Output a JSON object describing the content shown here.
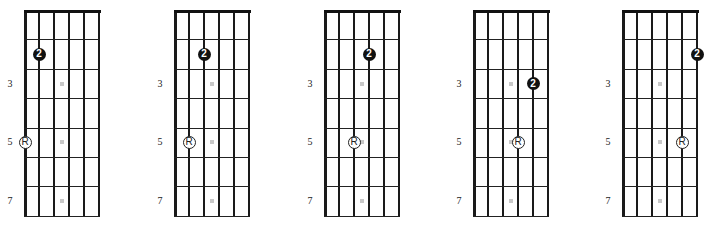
{
  "layout": {
    "diagram_lefts": [
      24,
      174,
      324,
      473,
      622
    ],
    "string_spacing": 15,
    "fret_spacing": 29.4,
    "grid_top": 10
  },
  "fret_labels": [
    {
      "text": "3",
      "row": 3
    },
    {
      "text": "5",
      "row": 5
    },
    {
      "text": "7",
      "row": 7
    }
  ],
  "inlay_rows": [
    3,
    5,
    7
  ],
  "diagrams": [
    {
      "name": "diagram-1",
      "finger": {
        "label": "2",
        "string": 2,
        "row": 2
      },
      "root": {
        "label": "R",
        "string": 1,
        "row": 5
      }
    },
    {
      "name": "diagram-2",
      "finger": {
        "label": "2",
        "string": 3,
        "row": 2
      },
      "root": {
        "label": "R",
        "string": 2,
        "row": 5
      }
    },
    {
      "name": "diagram-3",
      "finger": {
        "label": "2",
        "string": 4,
        "row": 2
      },
      "root": {
        "label": "R",
        "string": 3,
        "row": 5
      }
    },
    {
      "name": "diagram-4",
      "finger": {
        "label": "2",
        "string": 5,
        "row": 3
      },
      "root": {
        "label": "R",
        "string": 4,
        "row": 5
      }
    },
    {
      "name": "diagram-5",
      "finger": {
        "label": "2",
        "string": 6,
        "row": 2
      },
      "root": {
        "label": "R",
        "string": 5,
        "row": 5
      }
    }
  ],
  "colors": {
    "line": "#1a1a1a",
    "inlay": "#c8c8c8",
    "finger_fill": "#111111",
    "finger_text": "#ffffff",
    "root_fill": "#ffffff"
  }
}
